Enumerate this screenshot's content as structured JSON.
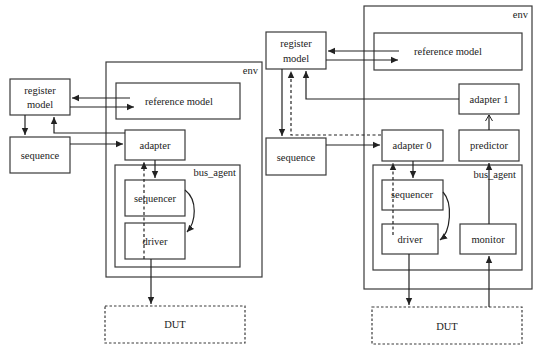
{
  "diagrams": [
    {
      "id": "left",
      "env_label": "env",
      "bus_agent_label": "bus_agent",
      "register_model": [
        "register",
        "model"
      ],
      "reference_model": "reference model",
      "sequence": "sequence",
      "adapter": "adapter",
      "sequencer": "sequencer",
      "driver": "driver",
      "dut": "DUT"
    },
    {
      "id": "right",
      "env_label": "env",
      "bus_agent_label": "bus_agent",
      "register_model": [
        "register",
        "model"
      ],
      "reference_model": "reference model",
      "sequence": "sequence",
      "adapter0": "adapter 0",
      "adapter1": "adapter 1",
      "predictor": "predictor",
      "sequencer": "sequencer",
      "driver": "driver",
      "monitor": "monitor",
      "dut": "DUT"
    }
  ],
  "colors": {
    "stroke": "#3a3a3a",
    "background": "#ffffff"
  }
}
